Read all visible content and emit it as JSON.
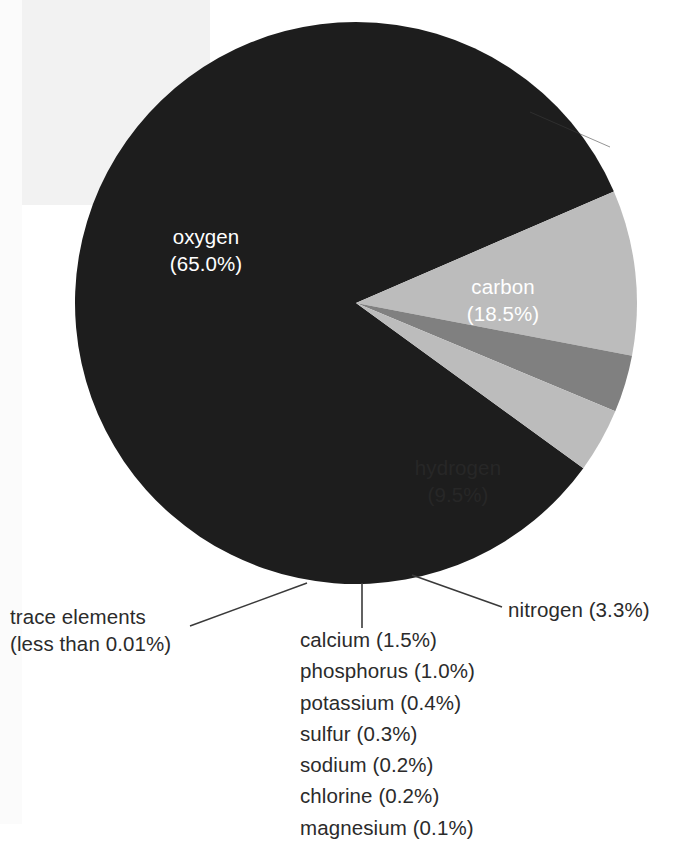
{
  "chart_data": {
    "type": "pie",
    "title": "",
    "subtitle": "",
    "xlabel": "",
    "ylabel": "",
    "legend_position": "none",
    "grid": false,
    "units": "percent of body mass",
    "categories": [
      "carbon",
      "hydrogen",
      "nitrogen",
      "trace elements",
      "oxygen"
    ],
    "values": [
      18.5,
      9.5,
      3.3,
      3.7,
      65.0
    ],
    "start_angle_deg": 0,
    "direction": "clockwise",
    "slices": [
      {
        "name": "oxygen",
        "label": "oxygen",
        "value": 65.0,
        "value_label": "(65.0%)",
        "color": "#1d1d1d",
        "label_color": "#ffffff",
        "label_placement": "inside"
      },
      {
        "name": "carbon",
        "label": "carbon",
        "value": 18.5,
        "value_label": "(18.5%)",
        "color": "#1d1d1d",
        "label_color": "#ffffff",
        "label_placement": "inside"
      },
      {
        "name": "hydrogen",
        "label": "hydrogen",
        "value": 9.5,
        "value_label": "(9.5%)",
        "color": "#bcbcbc",
        "label_color": "#272727",
        "label_placement": "inside"
      },
      {
        "name": "nitrogen",
        "label": "nitrogen (3.3%)",
        "value": 3.3,
        "value_label": "(3.3%)",
        "color": "#808080",
        "label_color": "#2b2b2b",
        "label_placement": "callout-right"
      },
      {
        "name": "trace-elements",
        "label": "trace elements",
        "sublabel": "(less than 0.01%)",
        "value": 3.7,
        "value_label": "(less than 0.01%)",
        "color": "#bcbcbc",
        "label_color": "#2b2b2b",
        "label_placement": "callout-left"
      }
    ],
    "minor_constituents": [
      {
        "name": "calcium",
        "value": 1.5,
        "text": "calcium (1.5%)"
      },
      {
        "name": "phosphorus",
        "value": 1.0,
        "text": "phosphorus (1.0%)"
      },
      {
        "name": "potassium",
        "value": 0.4,
        "text": "potassium (0.4%)"
      },
      {
        "name": "sulfur",
        "value": 0.3,
        "text": "sulfur (0.3%)"
      },
      {
        "name": "sodium",
        "value": 0.2,
        "text": "sodium (0.2%)"
      },
      {
        "name": "chlorine",
        "value": 0.2,
        "text": "chlorine (0.2%)"
      },
      {
        "name": "magnesium",
        "value": 0.1,
        "text": "magnesium (0.1%)"
      }
    ]
  },
  "labels": {
    "oxygen_line1": "oxygen",
    "oxygen_line2": "(65.0%)",
    "carbon_line1": "carbon",
    "carbon_line2": "(18.5%)",
    "hydrogen_line1": "hydrogen",
    "hydrogen_line2": "(9.5%)",
    "nitrogen": "nitrogen (3.3%)",
    "trace_line1": "trace elements",
    "trace_line2": "(less than 0.01%)"
  },
  "trace_items": [
    "calcium (1.5%)",
    "phosphorus (1.0%)",
    "potassium (0.4%)",
    "sulfur (0.3%)",
    "sodium (0.2%)",
    "chlorine (0.2%)",
    "magnesium (0.1%)"
  ],
  "colors": {
    "dark_slice": "#1d1d1d",
    "light_slice": "#bcbcbc",
    "mid_slice": "#808080",
    "background": "#ffffff",
    "text": "#2b2b2b",
    "leader_line": "#3a3a3a"
  }
}
